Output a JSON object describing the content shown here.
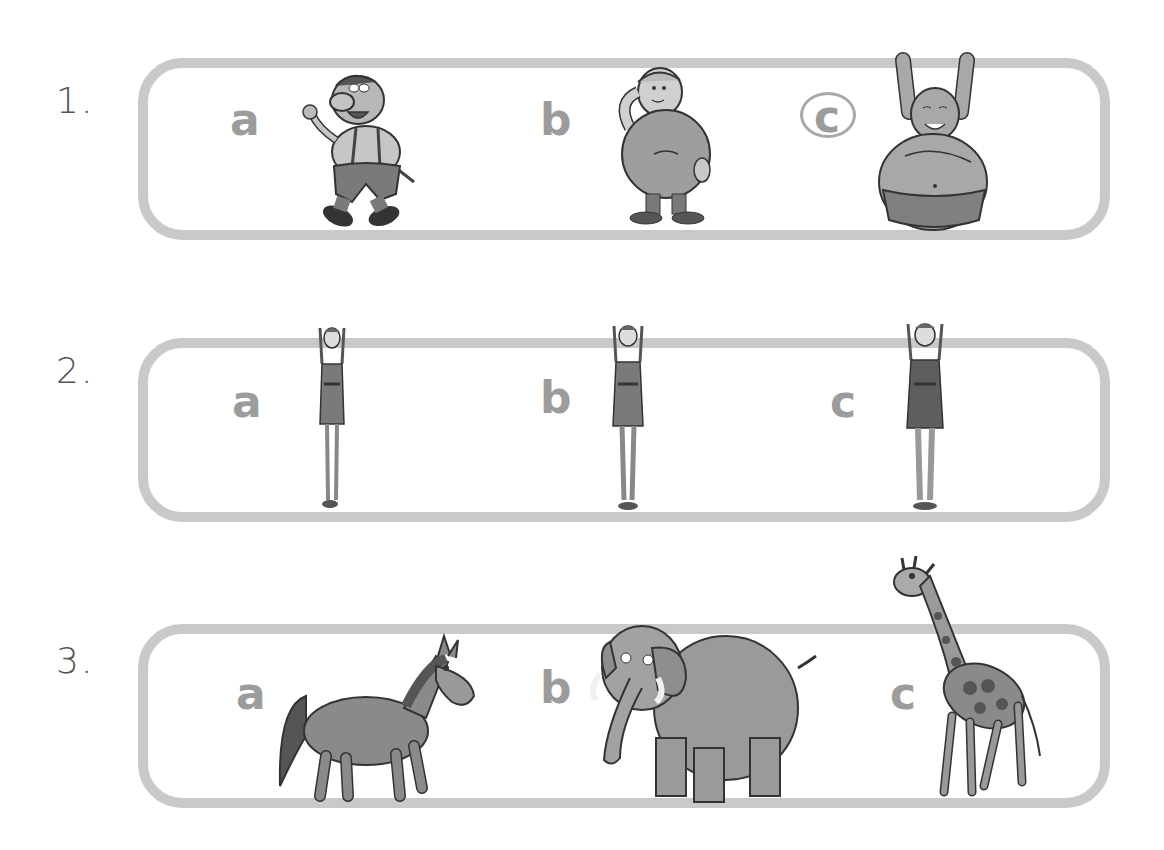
{
  "exercise": {
    "rows": [
      {
        "number": "1.",
        "options": [
          {
            "letter": "a",
            "picture": "short-man-walking-with-wrench",
            "selected": false
          },
          {
            "letter": "b",
            "picture": "chubby-boy-scratching-head",
            "selected": false
          },
          {
            "letter": "c",
            "picture": "very-fat-man-arms-raised",
            "selected": true
          }
        ]
      },
      {
        "number": "2.",
        "options": [
          {
            "letter": "a",
            "picture": "thin-girl-arms-up-short",
            "selected": false
          },
          {
            "letter": "b",
            "picture": "thin-girl-arms-up-medium",
            "selected": false
          },
          {
            "letter": "c",
            "picture": "thin-girl-arms-up-tall",
            "selected": false
          }
        ]
      },
      {
        "number": "3.",
        "options": [
          {
            "letter": "a",
            "picture": "horse",
            "selected": false
          },
          {
            "letter": "b",
            "picture": "elephant",
            "selected": false
          },
          {
            "letter": "c",
            "picture": "giraffe",
            "selected": false
          }
        ]
      }
    ]
  },
  "colors": {
    "frame": "#c9c9c9",
    "letter": "#9c9c9c",
    "number": "#555555",
    "answer_circle": "#a8a8a8"
  }
}
